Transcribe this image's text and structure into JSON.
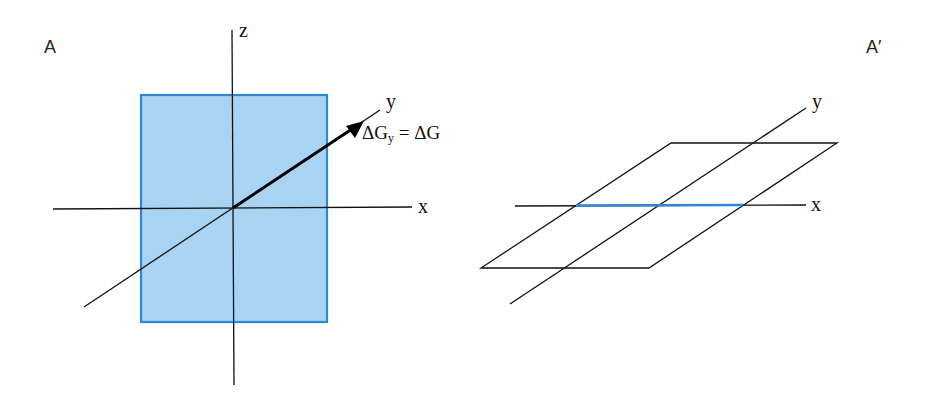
{
  "panels": [
    {
      "label": "A",
      "axes": {
        "x": "x",
        "y": "y",
        "z": "z"
      },
      "annotation": {
        "lhs_symbol": "ΔG",
        "lhs_subscript": "y",
        "equals": "=",
        "rhs": "ΔG"
      },
      "plane_fill_color": "#a9d3f3",
      "plane_border_color": "#2f86d4"
    },
    {
      "label": "A′",
      "axes": {
        "x": "x",
        "y": "y"
      },
      "highlight_color": "#2f86d4"
    }
  ]
}
